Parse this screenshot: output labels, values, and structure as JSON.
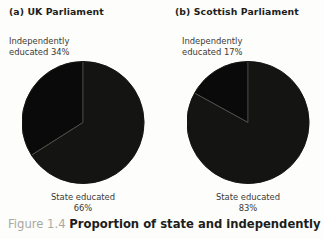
{
  "figure": {
    "caption_number": "Figure 1.4",
    "caption_text": "Proportion of state and independently",
    "background_color": "#fdfdfb",
    "ink_color": "#0d0d0d"
  },
  "panels": [
    {
      "title": "(a) UK Parliament",
      "independent_label_line1": "Independently",
      "independent_label_line2": "educated 34%",
      "state_label_line1": "State educated",
      "state_label_line2": "66%"
    },
    {
      "title": "(b) Scottish Parliament",
      "independent_label_line1": "Independently",
      "independent_label_line2": "educated 17%",
      "state_label_line1": "State educated",
      "state_label_line2": "83%"
    }
  ],
  "chart_data": [
    {
      "type": "pie",
      "title": "(a) UK Parliament",
      "categories": [
        "Independently educated",
        "State educated"
      ],
      "values": [
        34,
        66
      ],
      "unit": "percent",
      "labels": [
        "Independently educated 34%",
        "State educated 66%"
      ],
      "colors": [
        "#0a0a0a",
        "#141412"
      ],
      "start_angle_deg": 0,
      "direction": "counterclockwise",
      "legend": "none",
      "grid": false
    },
    {
      "type": "pie",
      "title": "(b) Scottish Parliament",
      "categories": [
        "Independently educated",
        "State educated"
      ],
      "values": [
        17,
        83
      ],
      "unit": "percent",
      "labels": [
        "Independently educated 17%",
        "State educated 83%"
      ],
      "colors": [
        "#0a0a0a",
        "#141412"
      ],
      "start_angle_deg": 0,
      "direction": "counterclockwise",
      "legend": "none",
      "grid": false
    }
  ]
}
